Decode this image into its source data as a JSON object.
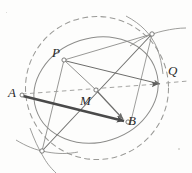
{
  "figure": {
    "width": 192,
    "height": 173,
    "background_color": "#fdfdfc"
  },
  "colors": {
    "line": "#8c8c8a",
    "line_dark": "#6d6d6b",
    "dashed": "#9a9a97",
    "arrow_thick": "#4a4a4a",
    "label": "#2a2a2a",
    "vertex_fill": "#ffffff",
    "vertex_stroke": "#7a7a78"
  },
  "labels": [
    {
      "name": "label-P",
      "text": "P",
      "x": 52,
      "y": 46
    },
    {
      "name": "label-Q",
      "text": "Q",
      "x": 168,
      "y": 64
    },
    {
      "name": "label-A",
      "text": "A",
      "x": 8,
      "y": 86
    },
    {
      "name": "label-M",
      "text": "M",
      "x": 80,
      "y": 94
    },
    {
      "name": "label-B",
      "text": "B",
      "x": 128,
      "y": 114
    }
  ],
  "points": [
    {
      "name": "point-P",
      "label": "P",
      "x": 64,
      "y": 60,
      "marker": "open-circle"
    },
    {
      "name": "point-M",
      "label": "M",
      "x": 96,
      "y": 90,
      "marker": "open-circle"
    },
    {
      "name": "point-A",
      "label": "A",
      "x": 22,
      "y": 96,
      "marker": "open-circle"
    },
    {
      "name": "point-B",
      "label": "B",
      "x": 127,
      "y": 122,
      "marker": "open-circle"
    },
    {
      "name": "point-Q",
      "label": "Q",
      "x": 163,
      "y": 83,
      "marker": "arrow-tip"
    },
    {
      "name": "point-upper-right-vertex",
      "label": "",
      "x": 152,
      "y": 34,
      "marker": "open-circle"
    },
    {
      "name": "point-lower-left-vertex",
      "label": "",
      "x": 42,
      "y": 151,
      "marker": "open-circle"
    }
  ],
  "shapes": {
    "ellipse": {
      "name": "solid-ellipse",
      "cx": 96,
      "cy": 90,
      "rx": 63,
      "ry": 52,
      "rotation_deg": -18,
      "style": "solid",
      "stroke": "#8c8c8a"
    },
    "circle": {
      "name": "dashed-circle",
      "cx": 97,
      "cy": 88,
      "r": 72,
      "style": "dashed",
      "stroke": "#9a9a97"
    }
  },
  "segments": [
    {
      "name": "segment-A-B",
      "from": "A",
      "to": "B",
      "style": "thick-arrow",
      "arrow": "both"
    },
    {
      "name": "segment-M-Q",
      "from": "M",
      "to": "Q",
      "style": "dashed",
      "arrow": "end"
    },
    {
      "name": "segment-P-Q",
      "from": "P",
      "to": "Q",
      "style": "solid",
      "arrow": "end"
    },
    {
      "name": "segment-P-M",
      "from": "P",
      "to": "M",
      "style": "solid",
      "arrow": "none"
    },
    {
      "name": "segment-P-lower-left",
      "from": "P",
      "to": "lower-left-vertex",
      "style": "solid",
      "arrow": "none"
    },
    {
      "name": "segment-M-B",
      "from": "M",
      "to": "B",
      "style": "solid-arrow",
      "arrow": "end"
    },
    {
      "name": "segment-upper-right-to-lower-left",
      "from": "upper-right-vertex",
      "to": "lower-left-vertex",
      "style": "solid",
      "arrow": "none"
    },
    {
      "name": "segment-P-upper-right",
      "from": "P",
      "to": "upper-right-vertex",
      "style": "solid",
      "arrow": "none"
    },
    {
      "name": "segment-A-dashed-left",
      "from": "A",
      "to": "M",
      "style": "dashed",
      "arrow": "none"
    }
  ],
  "construction_arcs": [
    {
      "name": "arc-upper-right-a",
      "description": "compass arc crossing at upper-right vertex"
    },
    {
      "name": "arc-upper-right-b",
      "description": "second compass arc crossing at upper-right vertex"
    },
    {
      "name": "arc-lower-left-a",
      "description": "compass arc crossing at lower-left vertex"
    },
    {
      "name": "arc-lower-left-b",
      "description": "second compass arc crossing at lower-left vertex"
    }
  ]
}
